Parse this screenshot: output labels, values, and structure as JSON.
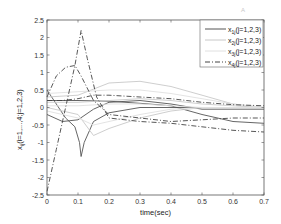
{
  "chart_data": {
    "type": "line",
    "title": "",
    "xlabel": "time(sec)",
    "ylabel": "x_ij(i=1,...,4;j=1,2,3)",
    "xlim": [
      0,
      0.7
    ],
    "ylim": [
      -2.5,
      2.5
    ],
    "xticks": [
      "0",
      "0.1",
      "0.2",
      "0.3",
      "0.4",
      "0.5",
      "0.6",
      "0.7"
    ],
    "yticks": [
      "2.5",
      "2",
      "1.5",
      "1",
      "0.5",
      "0",
      "-0.5",
      "-1",
      "-1.5",
      "-2",
      "-2.5"
    ],
    "grid": false,
    "legend_position": "upper right",
    "legend": [
      "x_1j(j=1,2,3)",
      "x_2j(j=1,2,3)",
      "x_3j(j=1,2,3)",
      "x_4j(j=1,2,3)"
    ],
    "series": [
      {
        "name": "x_11",
        "style": "solid",
        "color": "#555555",
        "x": [
          0,
          0.03,
          0.06,
          0.09,
          0.105,
          0.11,
          0.12,
          0.15,
          0.2,
          0.3,
          0.4,
          0.5,
          0.6,
          0.7
        ],
        "y": [
          0.5,
          0.1,
          -0.3,
          -0.55,
          -1.0,
          -1.4,
          -1.0,
          -0.4,
          -0.15,
          0.0,
          0.0,
          0.0,
          0.0,
          0.0
        ]
      },
      {
        "name": "x_12",
        "style": "solid",
        "color": "#555555",
        "x": [
          0,
          0.05,
          0.1,
          0.15,
          0.2,
          0.3,
          0.4,
          0.5,
          0.6,
          0.7
        ],
        "y": [
          -0.2,
          -0.4,
          -0.35,
          -0.05,
          0.15,
          0.2,
          0.1,
          -0.05,
          -0.05,
          -0.05
        ]
      },
      {
        "name": "x_13",
        "style": "solid",
        "color": "#555555",
        "x": [
          0,
          0.1,
          0.2,
          0.3,
          0.4,
          0.5,
          0.6,
          0.7
        ],
        "y": [
          0.2,
          0.2,
          0.18,
          0.12,
          0.05,
          -0.2,
          -0.4,
          -0.45
        ]
      },
      {
        "name": "x_21",
        "style": "solid",
        "color": "#c8c8c8",
        "x": [
          0,
          0.1,
          0.2,
          0.3,
          0.4,
          0.5,
          0.6,
          0.7
        ],
        "y": [
          0.3,
          0.35,
          0.7,
          0.75,
          0.6,
          0.35,
          0.1,
          0.0
        ]
      },
      {
        "name": "x_22",
        "style": "solid",
        "color": "#c8c8c8",
        "x": [
          0,
          0.1,
          0.15,
          0.2,
          0.3,
          0.4,
          0.5,
          0.6,
          0.7
        ],
        "y": [
          0.0,
          -0.2,
          -0.8,
          -0.6,
          -0.3,
          -0.1,
          0.0,
          0.0,
          0.0
        ]
      },
      {
        "name": "x_23",
        "style": "solid",
        "color": "#c8c8c8",
        "x": [
          0,
          0.1,
          0.2,
          0.3,
          0.4,
          0.5,
          0.6,
          0.7
        ],
        "y": [
          0.15,
          0.15,
          0.2,
          0.25,
          0.2,
          0.1,
          0.05,
          0.0
        ]
      },
      {
        "name": "x_31",
        "style": "solid",
        "color": "#e0e0e0",
        "x": [
          0,
          0.1,
          0.2,
          0.3,
          0.4,
          0.5,
          0.6,
          0.7
        ],
        "y": [
          0.4,
          0.45,
          0.5,
          0.5,
          0.4,
          0.25,
          0.1,
          0.0
        ]
      },
      {
        "name": "x_32",
        "style": "solid",
        "color": "#e0e0e0",
        "x": [
          0,
          0.1,
          0.15,
          0.2,
          0.3,
          0.4,
          0.5,
          0.6,
          0.7
        ],
        "y": [
          -0.1,
          -0.3,
          -0.5,
          -0.4,
          -0.2,
          -0.05,
          0.0,
          0.0,
          0.0
        ]
      },
      {
        "name": "x_33",
        "style": "solid",
        "color": "#e0e0e0",
        "x": [
          0,
          0.1,
          0.2,
          0.3,
          0.4,
          0.5,
          0.6,
          0.7
        ],
        "y": [
          0.05,
          0.05,
          0.1,
          0.1,
          0.05,
          0.0,
          0.0,
          0.0
        ]
      },
      {
        "name": "x_41",
        "style": "dashdot",
        "color": "#444444",
        "x": [
          0,
          0.03,
          0.06,
          0.09,
          0.11,
          0.13,
          0.16,
          0.2,
          0.3,
          0.4,
          0.5,
          0.6,
          0.7
        ],
        "y": [
          -2.4,
          -1.2,
          0.0,
          1.2,
          2.2,
          1.4,
          0.3,
          -0.3,
          -0.4,
          -0.45,
          -0.55,
          -0.65,
          -0.7
        ]
      },
      {
        "name": "x_42",
        "style": "dashdot",
        "color": "#444444",
        "x": [
          0,
          0.03,
          0.06,
          0.09,
          0.11,
          0.15,
          0.2,
          0.3,
          0.4,
          0.5,
          0.6,
          0.7
        ],
        "y": [
          0.3,
          0.9,
          1.15,
          1.2,
          0.9,
          0.2,
          -0.2,
          -0.3,
          -0.4,
          -0.35,
          -0.3,
          -0.3
        ]
      },
      {
        "name": "x_43",
        "style": "dashdot",
        "color": "#444444",
        "x": [
          0,
          0.05,
          0.1,
          0.15,
          0.2,
          0.3,
          0.4,
          0.5,
          0.6,
          0.7
        ],
        "y": [
          0.2,
          0.2,
          0.25,
          0.35,
          0.35,
          0.3,
          0.25,
          0.15,
          0.08,
          0.05
        ]
      }
    ]
  },
  "figure": {
    "xlabel": "time(sec)",
    "ylabel_main": "x",
    "ylabel_sub": "ij",
    "ylabel_rest": "(i=1,...,4;j=1,2,3)",
    "legend": [
      {
        "main": "x",
        "sub": "1j",
        "rest": "(j=1,2,3)"
      },
      {
        "main": "x",
        "sub": "2j",
        "rest": "(j=1,2,3)"
      },
      {
        "main": "x",
        "sub": "3j",
        "rest": "(j=1,2,3)"
      },
      {
        "main": "x",
        "sub": "4j",
        "rest": "(j=1,2,3)"
      }
    ],
    "watermark": "A"
  }
}
